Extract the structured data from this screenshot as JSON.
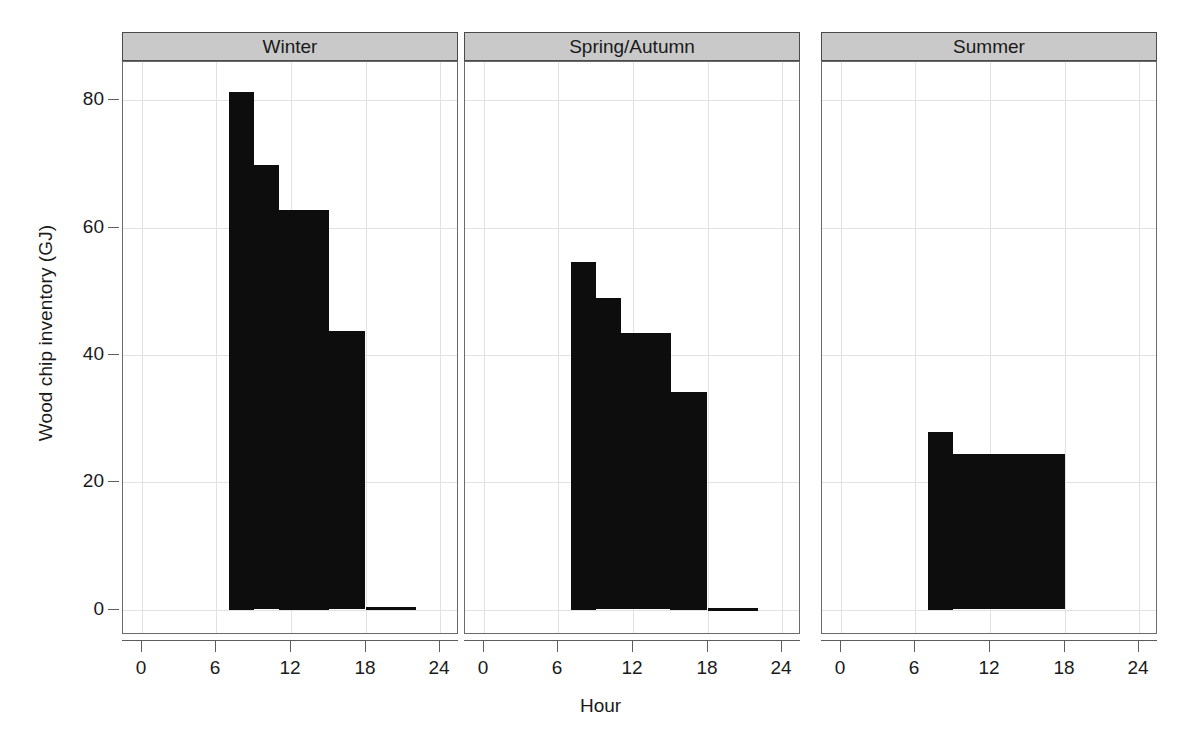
{
  "chart_data": {
    "type": "bar",
    "title": "",
    "subtitle": "",
    "xlabel": "Hour",
    "ylabel": "Wood chip inventory (GJ)",
    "xlim": [
      -1.5,
      25.5
    ],
    "ylim": [
      -4,
      86
    ],
    "xticks": [
      0,
      6,
      12,
      18,
      24
    ],
    "yticks": [
      0,
      20,
      40,
      60,
      80
    ],
    "xtick_labels": [
      "0",
      "6",
      "12",
      "18",
      "24"
    ],
    "ytick_labels": [
      "0",
      "20",
      "40",
      "60",
      "80"
    ],
    "grid": true,
    "legend": "none",
    "bar_color": "#0d0d0d",
    "strip_color": "#c9c9c9",
    "panel_layout": "1 row x 3 columns",
    "panels": [
      {
        "label": "Winter",
        "bars": [
          {
            "x_start": 7,
            "x_end": 9,
            "value": 81.3
          },
          {
            "x_start": 9,
            "x_end": 11,
            "value": 69.8
          },
          {
            "x_start": 11,
            "x_end": 15,
            "value": 62.8
          },
          {
            "x_start": 15,
            "x_end": 18,
            "value": 43.7
          },
          {
            "x_start": 18,
            "x_end": 22,
            "value": 0.4
          }
        ]
      },
      {
        "label": "Spring/Autumn",
        "bars": [
          {
            "x_start": 7,
            "x_end": 9,
            "value": 54.6
          },
          {
            "x_start": 9,
            "x_end": 11,
            "value": 48.9
          },
          {
            "x_start": 11,
            "x_end": 15,
            "value": 43.4
          },
          {
            "x_start": 15,
            "x_end": 18,
            "value": 34.2
          },
          {
            "x_start": 18,
            "x_end": 22,
            "value": 0.3
          }
        ]
      },
      {
        "label": "Summer",
        "bars": [
          {
            "x_start": 7,
            "x_end": 9,
            "value": 27.9
          },
          {
            "x_start": 9,
            "x_end": 18,
            "value": 24.4
          }
        ]
      }
    ]
  }
}
